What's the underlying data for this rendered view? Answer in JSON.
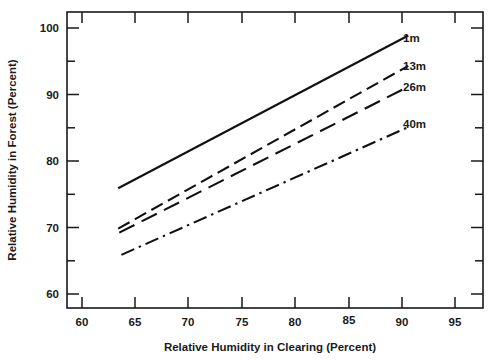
{
  "chart_data": {
    "type": "line",
    "title": "",
    "xlabel": "Relative Humidity in Clearing (Percent)",
    "ylabel": "Relative Humidity in Forest (Percent)",
    "xlim": [
      57.5,
      96.5
    ],
    "ylim": [
      57.5,
      101.5
    ],
    "xticks": [
      60,
      65,
      70,
      75,
      80,
      85,
      90,
      95
    ],
    "xtick_labels": [
      "60",
      "65",
      "70",
      "75",
      "80",
      "85",
      "90",
      "95"
    ],
    "yticks": [
      60,
      70,
      80,
      90,
      100
    ],
    "ytick_labels": [
      "60",
      "70",
      "80",
      "90",
      "100"
    ],
    "yticks_minor": [
      65,
      75,
      85,
      95
    ],
    "xticks_minor": [],
    "grid": false,
    "legend_position": "inline-right-end",
    "series": [
      {
        "name": "1m",
        "label": "1m",
        "linestyle": "solid",
        "x": [
          62.3,
          89.5
        ],
        "y": [
          75.3,
          98.0
        ]
      },
      {
        "name": "13m",
        "label": "13m",
        "linestyle": "dashed",
        "x": [
          62.3,
          89.5
        ],
        "y": [
          69.3,
          93.5
        ]
      },
      {
        "name": "26m",
        "label": "26m",
        "linestyle": "long-dashed",
        "x": [
          62.4,
          89.5
        ],
        "y": [
          68.7,
          90.4
        ]
      },
      {
        "name": "40m",
        "label": "40m",
        "linestyle": "dash-dot",
        "x": [
          62.6,
          89.5
        ],
        "y": [
          65.4,
          84.4
        ]
      }
    ],
    "colors": {
      "line": "#111111",
      "axis": "#1a1a1a",
      "background": "#ffffff"
    }
  }
}
